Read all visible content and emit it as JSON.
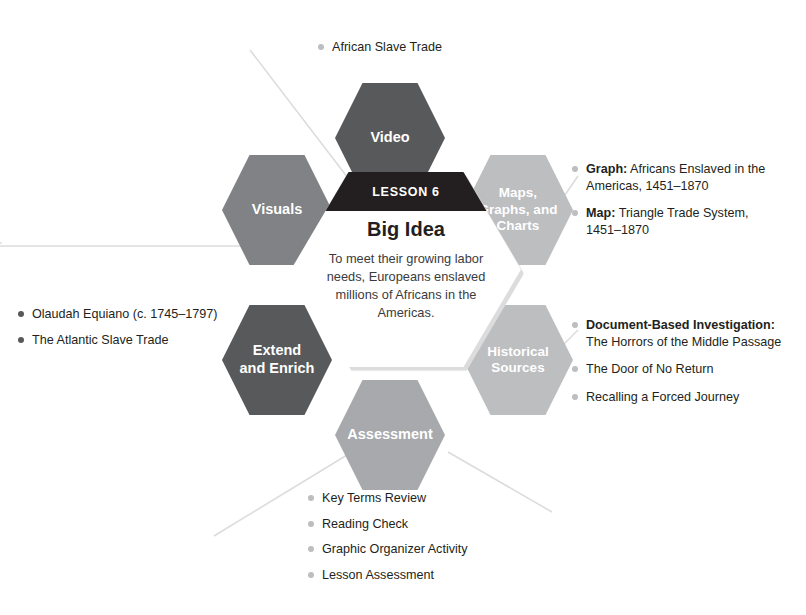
{
  "center": {
    "lesson_label": "LESSON 6",
    "title": "Big Idea",
    "body": "To meet their growing labor needs, Europeans enslaved millions of Africans in the Americas."
  },
  "nodes": {
    "video": {
      "label": "Video",
      "color": "#58595b"
    },
    "visuals": {
      "label": "Visuals",
      "color": "#808285"
    },
    "maps": {
      "label_line1": "Maps,",
      "label_line2": "Graphs, and",
      "label_line3": "Charts",
      "color": "#bcbec0"
    },
    "extend": {
      "label_line1": "Extend",
      "label_line2": "and Enrich",
      "color": "#58595b"
    },
    "historical": {
      "label_line1": "Historical",
      "label_line2": "Sources",
      "color": "#bcbec0"
    },
    "assessment": {
      "label": "Assessment",
      "color": "#a7a9ac"
    }
  },
  "lists": {
    "video_items": [
      {
        "text": "African Slave Trade"
      }
    ],
    "maps_items": [
      {
        "strong": "Graph:",
        "text": " Africans Enslaved in the",
        "sub": "Americas, 1451–1870"
      },
      {
        "strong": "Map:",
        "text": " Triangle Trade System,",
        "sub": "1451–1870"
      }
    ],
    "historical_items": [
      {
        "strong": "Document-Based Investigation:",
        "text": "",
        "sub": "The Horrors of the Middle Passage"
      },
      {
        "strong": "",
        "text": "The Door of No Return",
        "sub": ""
      },
      {
        "strong": "",
        "text": "Recalling a Forced Journey",
        "sub": ""
      }
    ],
    "extend_items": [
      {
        "text": "Olaudah Equiano (c. 1745–1797)"
      },
      {
        "text": "The Atlantic Slave Trade"
      }
    ],
    "assessment_items": [
      {
        "text": "Key Terms Review"
      },
      {
        "text": "Reading Check"
      },
      {
        "text": "Graphic Organizer Activity"
      },
      {
        "text": "Lesson Assessment"
      }
    ]
  },
  "colors": {
    "dark": "#231f20",
    "mid_dark": "#58595b",
    "mid": "#808285",
    "mid_light": "#a7a9ac",
    "light": "#bcbec0",
    "line": "#d8d8d8"
  }
}
